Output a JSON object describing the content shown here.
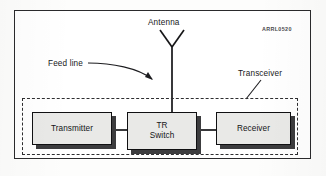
{
  "figure": {
    "watermark": "ARRL0520",
    "background_color": "#fdfdfc",
    "frame_color": "#2a2a2c",
    "block_fill_color": "#e9e9e7",
    "block_border_color": "#101012",
    "shadow_color": "#3c3c3e",
    "dash_color": "#2e2e30",
    "ink_color": "#18181a"
  },
  "labels": {
    "antenna": "Antenna",
    "feed_line": "Feed line",
    "transceiver": "Transceiver"
  },
  "blocks": [
    {
      "id": "transmitter",
      "label": "Transmitter"
    },
    {
      "id": "tr-switch",
      "label_line1": "TR",
      "label_line2": "Switch"
    },
    {
      "id": "receiver",
      "label": "Receiver"
    }
  ],
  "icons": {
    "antenna": "v-dipole-antenna-icon",
    "feed_line_pointer": "curved-arrow-icon",
    "transceiver_pointer": "leader-line-icon"
  }
}
